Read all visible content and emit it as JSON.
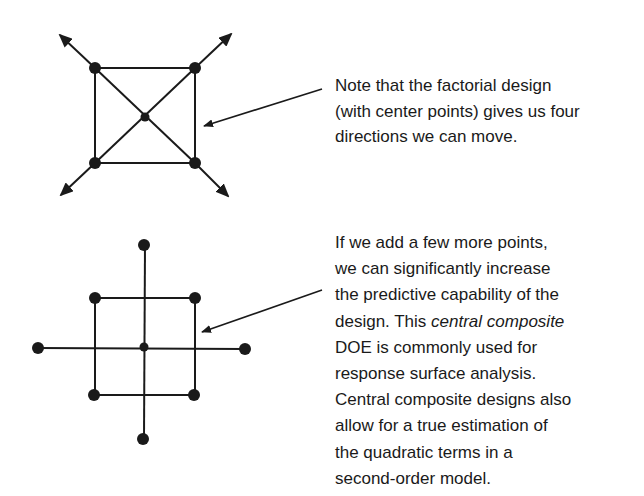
{
  "colors": {
    "ink": "#1a1a1a",
    "background": "#ffffff"
  },
  "top_note": {
    "lines": [
      "Note that the factorial design",
      "(with center points) gives us four",
      "directions we can move."
    ]
  },
  "bottom_note": {
    "line1": "If we add a few more points,",
    "line2": "we can significantly increase",
    "line3": "the predictive capability of the",
    "line4_pre": "design. This ",
    "line4_italic": "central composite",
    "line5": "DOE is commonly used for",
    "line6": "response surface analysis.",
    "line7": "Central composite designs also",
    "line8": "allow for a true estimation of",
    "line9": "the quadratic terms in a",
    "line10": "second-order model."
  },
  "factorial_diagram": {
    "corner_points": [
      [
        95,
        68
      ],
      [
        195,
        68
      ],
      [
        95,
        163
      ],
      [
        195,
        163
      ]
    ],
    "center_point": [
      145,
      117
    ],
    "direction_arrows": 4
  },
  "central_composite_diagram": {
    "corner_points": [
      [
        95,
        298
      ],
      [
        195,
        298
      ],
      [
        95,
        395
      ],
      [
        195,
        395
      ]
    ],
    "center_point": [
      145,
      347
    ],
    "axial_points": [
      [
        145,
        245
      ],
      [
        38,
        348
      ],
      [
        245,
        348
      ],
      [
        145,
        438
      ]
    ]
  }
}
